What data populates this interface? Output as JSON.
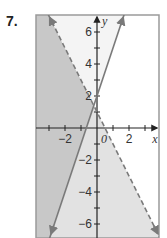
{
  "problem": {
    "number": "7."
  },
  "chart_data": {
    "type": "line",
    "title": "",
    "xlabel": "x",
    "ylabel": "y",
    "xlim": [
      -3.8,
      3.9
    ],
    "ylim": [
      -6.9,
      7.1
    ],
    "grid": false,
    "x_ticks": [
      -3,
      -2,
      -1,
      0,
      1,
      2,
      3
    ],
    "x_tick_labels": {
      "-2": "−2",
      "0": "0",
      "2": "2"
    },
    "y_ticks": [
      -6,
      -5,
      -4,
      -3,
      -2,
      -1,
      1,
      2,
      3,
      4,
      5,
      6
    ],
    "y_tick_labels": {
      "6": "6",
      "4": "4",
      "2": "2",
      "-2": "−2",
      "-4": "−4",
      "-6": "−6"
    },
    "series": [
      {
        "name": "boundary-solid",
        "equation": "y = 3x + 2",
        "slope": 3,
        "intercept": 2,
        "style": "solid",
        "arrows": true
      },
      {
        "name": "boundary-dashed",
        "equation": "y = -2x + 1",
        "slope": -2,
        "intercept": 1,
        "style": "dashed",
        "arrows": true
      }
    ],
    "shading": [
      {
        "region": "left of solid line and below dashed line",
        "inequalities": [
          "y > 3x + 2",
          "y < -2x + 1"
        ],
        "shade": "dark"
      },
      {
        "region": "below dashed line, right of solid line",
        "inequalities": [
          "y < -2x + 1",
          "y < 3x + 2"
        ],
        "shade": "light"
      }
    ]
  },
  "colors": {
    "dark_shade": "#c8c8c8",
    "light_shade": "#e2e2e2",
    "line": "#7a7a7a",
    "axis": "#222222",
    "frame": "#9a9a9a"
  }
}
